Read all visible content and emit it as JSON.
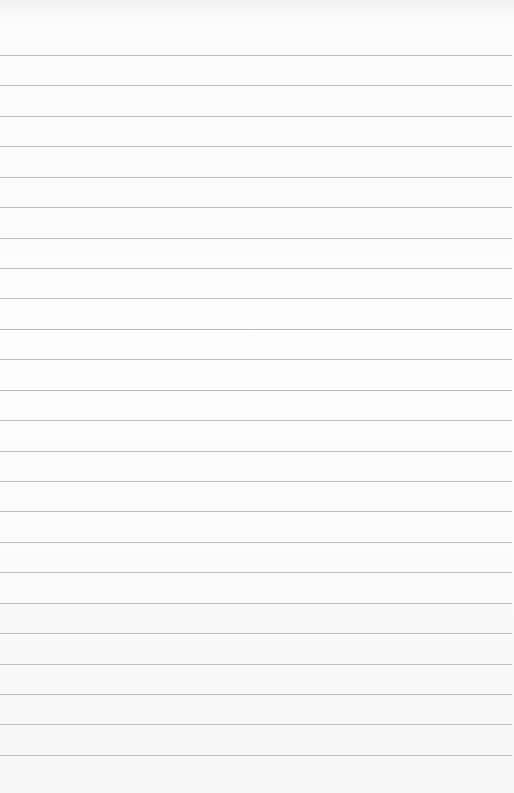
{
  "page": {
    "type": "lined-paper",
    "background_color": "#fbfbfb",
    "line_color": "#bdbdbd",
    "line_count": 24,
    "first_line_y": 55,
    "line_spacing": 30.43,
    "text": ""
  }
}
